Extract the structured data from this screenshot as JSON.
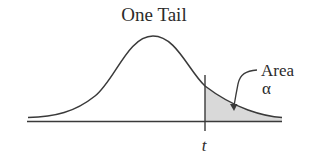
{
  "diagram": {
    "title": "One Tail",
    "annotation": {
      "line1": "Area",
      "line2": "α"
    },
    "critical_value_label": "t",
    "colors": {
      "stroke": "#3a3a3a",
      "shaded_area": "#d9d9d9",
      "text": "#2b2b2b",
      "background": "#ffffff"
    }
  }
}
